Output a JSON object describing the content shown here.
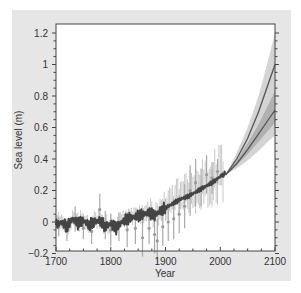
{
  "chart_data": {
    "type": "line",
    "title": "",
    "xlabel": "Year",
    "ylabel": "Sea level (m)",
    "xlim": [
      1700,
      2100
    ],
    "ylim": [
      -0.2,
      1.25
    ],
    "x_ticks": [
      1700,
      1800,
      1900,
      2000,
      2100
    ],
    "x_tick_labels": [
      "1700",
      "1800",
      "1900",
      "2000",
      "2100"
    ],
    "y_ticks": [
      -0.2,
      0,
      0.2,
      0.4,
      0.6,
      0.8,
      1,
      1.2
    ],
    "y_tick_labels": [
      "−0.2",
      "0",
      "0.2",
      "0.4",
      "0.6",
      "0.8",
      "1",
      "1.2"
    ],
    "grid": false,
    "legend": null,
    "series": [
      {
        "name": "Reconstructed sea level (historical)",
        "style": "dark line",
        "color": "#444444",
        "x": [
          1700,
          1710,
          1720,
          1730,
          1740,
          1750,
          1760,
          1770,
          1780,
          1790,
          1800,
          1810,
          1820,
          1830,
          1840,
          1850,
          1860,
          1870,
          1880,
          1890,
          1900,
          1910,
          1920,
          1930,
          1940,
          1950,
          1960,
          1970,
          1980,
          1990,
          2000,
          2010
        ],
        "values": [
          -0.02,
          0.0,
          -0.03,
          0.02,
          -0.01,
          0.01,
          -0.02,
          0.0,
          0.01,
          -0.03,
          -0.01,
          -0.04,
          0.0,
          0.02,
          0.03,
          0.04,
          0.05,
          0.06,
          0.04,
          0.07,
          0.09,
          0.11,
          0.13,
          0.15,
          0.16,
          0.18,
          0.2,
          0.22,
          0.24,
          0.26,
          0.29,
          0.31
        ]
      },
      {
        "name": "Observations with error bars",
        "style": "gray markers with vertical error bars",
        "color": "#aaaaaa",
        "x": [
          1705,
          1720,
          1735,
          1750,
          1765,
          1780,
          1790,
          1800,
          1815,
          1830,
          1845,
          1858,
          1870,
          1880,
          1885,
          1895,
          1905,
          1915,
          1925,
          1935,
          1945,
          1955,
          1965,
          1975,
          1985,
          1995
        ],
        "values": [
          -0.03,
          -0.05,
          0.02,
          -0.04,
          -0.06,
          0.08,
          -0.02,
          -0.05,
          -0.03,
          -0.05,
          -0.04,
          -0.1,
          -0.04,
          -0.08,
          -0.12,
          -0.03,
          0.0,
          0.02,
          0.05,
          0.1,
          0.2,
          0.25,
          0.22,
          0.3,
          0.28,
          0.32
        ],
        "error": [
          0.06,
          0.07,
          0.08,
          0.07,
          0.08,
          0.1,
          0.09,
          0.1,
          0.09,
          0.11,
          0.1,
          0.12,
          0.1,
          0.12,
          0.14,
          0.12,
          0.12,
          0.13,
          0.12,
          0.14,
          0.16,
          0.15,
          0.12,
          0.12,
          0.1,
          0.08
        ]
      },
      {
        "name": "Projection upper (central)",
        "style": "dark line",
        "color": "#555555",
        "x": [
          2010,
          2030,
          2050,
          2070,
          2090,
          2100
        ],
        "values": [
          0.3,
          0.4,
          0.53,
          0.7,
          0.9,
          1.0
        ]
      },
      {
        "name": "Projection lower (central)",
        "style": "dark line",
        "color": "#555555",
        "x": [
          2010,
          2030,
          2050,
          2070,
          2090,
          2100
        ],
        "values": [
          0.3,
          0.37,
          0.46,
          0.56,
          0.66,
          0.71
        ]
      }
    ],
    "bands": [
      {
        "name": "Projection outer uncertainty range",
        "color": "#cccccc",
        "x": [
          2010,
          2030,
          2050,
          2070,
          2090,
          2100
        ],
        "upper": [
          0.3,
          0.44,
          0.6,
          0.8,
          1.06,
          1.2
        ],
        "lower": [
          0.3,
          0.34,
          0.39,
          0.45,
          0.52,
          0.55
        ]
      },
      {
        "name": "Projection inner uncertainty range",
        "color": "#a8a8a8",
        "x": [
          2010,
          2030,
          2050,
          2070,
          2090,
          2100
        ],
        "upper": [
          0.3,
          0.39,
          0.5,
          0.62,
          0.76,
          0.83
        ],
        "lower": [
          0.3,
          0.36,
          0.43,
          0.51,
          0.59,
          0.63
        ]
      }
    ]
  },
  "layout": {
    "plot_left_px": 56,
    "plot_right_px": 275,
    "plot_top_px": 24,
    "plot_bottom_px": 251,
    "zero_y_px": 222,
    "px_per_unit_y": 157.5
  }
}
